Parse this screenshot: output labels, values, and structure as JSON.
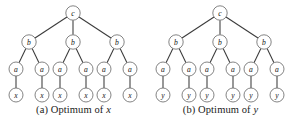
{
  "figure": {
    "background_color": "#ffffff",
    "edge_color": "#3a3a3a",
    "node_stroke_color": "#6e6e6e",
    "node_fill_color": "#ffffff",
    "label_color": "#141414"
  },
  "panels": [
    {
      "id": "a",
      "caption_prefix": "(a) Optimum of ",
      "caption_variable": "x",
      "caption_full": "(a) Optimum of x",
      "root": {
        "label": "c",
        "cx": 73,
        "cy": 13,
        "r": 7.2
      },
      "level_b": [
        {
          "label": "b",
          "cx": 29,
          "cy": 42,
          "r": 7.2
        },
        {
          "label": "b",
          "cx": 73,
          "cy": 42,
          "r": 7.2
        },
        {
          "label": "b",
          "cx": 117,
          "cy": 42,
          "r": 7.2
        }
      ],
      "level_a": [
        {
          "label": "a",
          "cx": 16,
          "cy": 69,
          "r": 7.0
        },
        {
          "label": "a",
          "cx": 42,
          "cy": 69,
          "r": 7.0
        },
        {
          "label": "a",
          "cx": 60,
          "cy": 69,
          "r": 7.0
        },
        {
          "label": "a",
          "cx": 86,
          "cy": 69,
          "r": 7.0
        },
        {
          "label": "a",
          "cx": 104,
          "cy": 69,
          "r": 7.0
        },
        {
          "label": "a",
          "cx": 130,
          "cy": 69,
          "r": 7.0
        }
      ],
      "level_leaf": [
        {
          "label": "x",
          "cx": 16,
          "cy": 95,
          "r": 7.0
        },
        {
          "label": "x",
          "cx": 42,
          "cy": 95,
          "r": 7.0
        },
        {
          "label": "x",
          "cx": 60,
          "cy": 95,
          "r": 7.0
        },
        {
          "label": "x",
          "cx": 86,
          "cy": 95,
          "r": 7.0
        },
        {
          "label": "x",
          "cx": 104,
          "cy": 95,
          "r": 7.0
        },
        {
          "label": "x",
          "cx": 130,
          "cy": 95,
          "r": 7.0
        }
      ]
    },
    {
      "id": "b",
      "caption_prefix": "(b) Optimum of ",
      "caption_variable": "y",
      "caption_full": "(b) Optimum of y",
      "root": {
        "label": "c",
        "cx": 73,
        "cy": 13,
        "r": 7.2
      },
      "level_b": [
        {
          "label": "b",
          "cx": 29,
          "cy": 42,
          "r": 7.2
        },
        {
          "label": "b",
          "cx": 73,
          "cy": 42,
          "r": 7.2
        },
        {
          "label": "b",
          "cx": 117,
          "cy": 42,
          "r": 7.2
        }
      ],
      "level_a": [
        {
          "label": "a",
          "cx": 16,
          "cy": 69,
          "r": 7.0
        },
        {
          "label": "a",
          "cx": 42,
          "cy": 69,
          "r": 7.0
        },
        {
          "label": "a",
          "cx": 60,
          "cy": 69,
          "r": 7.0
        },
        {
          "label": "a",
          "cx": 86,
          "cy": 69,
          "r": 7.0
        },
        {
          "label": "a",
          "cx": 104,
          "cy": 69,
          "r": 7.0
        },
        {
          "label": "a",
          "cx": 130,
          "cy": 69,
          "r": 7.0
        }
      ],
      "level_leaf": [
        {
          "label": "y",
          "cx": 16,
          "cy": 95,
          "r": 7.0
        },
        {
          "label": "y",
          "cx": 42,
          "cy": 95,
          "r": 7.0
        },
        {
          "label": "y",
          "cx": 60,
          "cy": 95,
          "r": 7.0
        },
        {
          "label": "y",
          "cx": 86,
          "cy": 95,
          "r": 7.0
        },
        {
          "label": "y",
          "cx": 104,
          "cy": 95,
          "r": 7.0
        },
        {
          "label": "y",
          "cx": 130,
          "cy": 95,
          "r": 7.0
        }
      ]
    }
  ]
}
